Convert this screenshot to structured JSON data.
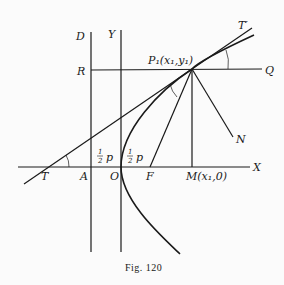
{
  "figure": {
    "caption": "Fig. 120",
    "caption_prefix": "Fig.",
    "caption_number": "120"
  },
  "labels": {
    "D": "D",
    "Y": "Y",
    "R": "R",
    "Q": "Q",
    "T": "T",
    "T_prime": "T′",
    "A": "A",
    "O": "O",
    "F": "F",
    "X": "X",
    "N": "N",
    "P1": "P₁(x₁,y₁)",
    "M": "M(x₁,0)",
    "half_p_left_num": "1",
    "half_p_left_den": "2",
    "half_p_left_var": "p",
    "half_p_right_num": "1",
    "half_p_right_den": "2",
    "half_p_right_var": "p"
  },
  "colors": {
    "ink": "#1a1a1a",
    "background": "#fbfbfb"
  }
}
